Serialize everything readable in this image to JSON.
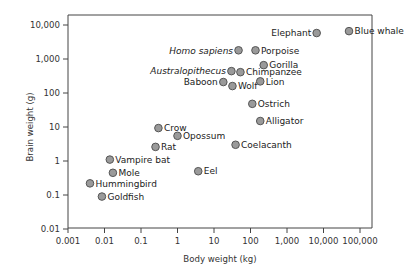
{
  "chart_data": {
    "type": "scatter",
    "title": "",
    "xlabel": "Body weight (kg)",
    "ylabel": "Brain weight (g)",
    "xscale": "log",
    "yscale": "log",
    "xlim": [
      0.001,
      100000
    ],
    "ylim": [
      0.01,
      10000
    ],
    "grid": false,
    "legend": null,
    "x_ticks": [
      0.001,
      0.01,
      0.1,
      1,
      10,
      100,
      1000,
      10000,
      100000
    ],
    "x_tick_labels": [
      "0.001",
      "0.01",
      "0.1",
      "1",
      "10",
      "100",
      "1,000",
      "10,000",
      "100,000"
    ],
    "y_ticks": [
      0.01,
      0.1,
      1,
      10,
      100,
      1000,
      10000
    ],
    "y_tick_labels": [
      "0.01",
      "0.1",
      "1",
      "10",
      "100",
      "1,000",
      "10,000"
    ],
    "marker_color": "#9a9a9a",
    "marker_edge_color": "#555555",
    "points": [
      {
        "label": "Blue whale",
        "x": 50000,
        "y": 6600,
        "label_side": "right",
        "italic": false
      },
      {
        "label": "Elephant",
        "x": 6500,
        "y": 5800,
        "label_side": "left",
        "italic": false
      },
      {
        "label": "Homo sapiens",
        "x": 47,
        "y": 1800,
        "label_side": "left",
        "italic": true
      },
      {
        "label": "Porpoise",
        "x": 137,
        "y": 1800,
        "label_side": "right",
        "italic": false
      },
      {
        "label": "Gorilla",
        "x": 230,
        "y": 660,
        "label_side": "right",
        "italic": false
      },
      {
        "label": "Australopithecus",
        "x": 30,
        "y": 440,
        "label_side": "left",
        "italic": true
      },
      {
        "label": "Chimpanzee",
        "x": 53,
        "y": 410,
        "label_side": "right",
        "italic": false
      },
      {
        "label": "Baboon",
        "x": 18,
        "y": 210,
        "label_side": "left",
        "italic": false
      },
      {
        "label": "Wolf",
        "x": 32,
        "y": 160,
        "label_side": "right",
        "italic": false
      },
      {
        "label": "Lion",
        "x": 185,
        "y": 220,
        "label_side": "right",
        "italic": false
      },
      {
        "label": "Ostrich",
        "x": 112,
        "y": 48,
        "label_side": "right",
        "italic": false
      },
      {
        "label": "Alligator",
        "x": 185,
        "y": 15,
        "label_side": "right",
        "italic": false
      },
      {
        "label": "Coelacanth",
        "x": 39,
        "y": 3,
        "label_side": "right",
        "italic": false
      },
      {
        "label": "Crow",
        "x": 0.3,
        "y": 9.3,
        "label_side": "right",
        "italic": false
      },
      {
        "label": "Opossum",
        "x": 1.0,
        "y": 5.5,
        "label_side": "right",
        "italic": false
      },
      {
        "label": "Rat",
        "x": 0.25,
        "y": 2.6,
        "label_side": "right",
        "italic": false
      },
      {
        "label": "Eel",
        "x": 3.7,
        "y": 0.5,
        "label_side": "right",
        "italic": false
      },
      {
        "label": "Vampire bat",
        "x": 0.014,
        "y": 1.1,
        "label_side": "right",
        "italic": false
      },
      {
        "label": "Mole",
        "x": 0.017,
        "y": 0.45,
        "label_side": "right",
        "italic": false
      },
      {
        "label": "Hummingbird",
        "x": 0.004,
        "y": 0.22,
        "label_side": "right",
        "italic": false
      },
      {
        "label": "Goldfish",
        "x": 0.0085,
        "y": 0.09,
        "label_side": "right",
        "italic": false
      }
    ]
  }
}
